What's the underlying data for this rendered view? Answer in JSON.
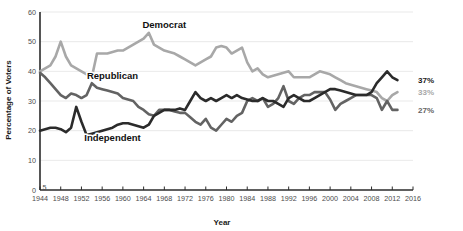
{
  "chart_data": {
    "type": "line",
    "title": "",
    "xlabel": "Year",
    "ylabel": "Percentage of Voters",
    "xlim": [
      1944,
      2016
    ],
    "ylim": [
      0,
      60
    ],
    "grid": true,
    "legend_position": "inline-annotations",
    "xticks": [
      1944,
      1948,
      1952,
      1956,
      1960,
      1964,
      1968,
      1972,
      1976,
      1980,
      1984,
      1988,
      1992,
      1996,
      2000,
      2004,
      2008,
      2012,
      2016
    ],
    "xtick_labels": [
      "1944",
      "1948",
      "1952",
      "1956",
      "1960",
      "1964",
      "1968",
      "1972",
      "1976",
      "1980",
      "1984",
      "1988",
      "1992",
      "1996",
      "2000",
      "2004",
      "2008",
      "2012",
      "2016"
    ],
    "yticks": [
      0,
      10,
      20,
      30,
      40,
      50,
      60
    ],
    "ytick_labels": [
      "0",
      "10",
      "20",
      "30",
      "40",
      "50",
      "60"
    ],
    "y_axis_break_marker": "5",
    "series": [
      {
        "name": "Democrat",
        "color": "#a8a8a8",
        "label_x": 1968,
        "label_y": 54.5,
        "end_label": "33%",
        "x": [
          1944,
          1945,
          1946,
          1947,
          1948,
          1949,
          1950,
          1951,
          1952,
          1953,
          1954,
          1955,
          1956,
          1957,
          1958,
          1959,
          1960,
          1961,
          1962,
          1963,
          1964,
          1965,
          1966,
          1967,
          1968,
          1969,
          1970,
          1971,
          1972,
          1973,
          1974,
          1975,
          1976,
          1977,
          1978,
          1979,
          1980,
          1981,
          1982,
          1983,
          1984,
          1985,
          1986,
          1987,
          1988,
          1989,
          1990,
          1991,
          1992,
          1993,
          1994,
          1995,
          1996,
          1997,
          1998,
          1999,
          2000,
          2001,
          2002,
          2003,
          2004,
          2005,
          2006,
          2007,
          2008,
          2009,
          2010,
          2011,
          2012,
          2013
        ],
        "y": [
          40,
          41,
          42,
          45,
          50,
          45,
          42,
          41,
          40,
          39,
          38,
          46,
          46,
          46,
          46.5,
          47,
          47,
          48,
          49,
          50,
          51,
          53,
          49,
          48,
          47,
          46.5,
          46,
          45,
          44,
          43,
          42,
          43,
          44,
          45,
          48,
          48.5,
          48,
          46,
          47,
          48,
          43,
          40,
          41,
          39,
          38,
          38.5,
          39,
          39.5,
          40,
          38,
          38,
          38,
          38,
          39,
          40,
          39.5,
          39,
          38,
          37,
          36,
          35.5,
          35,
          34.5,
          34,
          33.5,
          33,
          31,
          30,
          32,
          33
        ]
      },
      {
        "name": "Republican",
        "color": "#636363",
        "label_x": 1958,
        "label_y": 37.5,
        "end_label": "27%",
        "x": [
          1944,
          1945,
          1946,
          1947,
          1948,
          1949,
          1950,
          1951,
          1952,
          1953,
          1954,
          1955,
          1956,
          1957,
          1958,
          1959,
          1960,
          1961,
          1962,
          1963,
          1964,
          1965,
          1966,
          1967,
          1968,
          1969,
          1970,
          1971,
          1972,
          1973,
          1974,
          1975,
          1976,
          1977,
          1978,
          1979,
          1980,
          1981,
          1982,
          1983,
          1984,
          1985,
          1986,
          1987,
          1988,
          1989,
          1990,
          1991,
          1992,
          1993,
          1994,
          1995,
          1996,
          1997,
          1998,
          1999,
          2000,
          2001,
          2002,
          2003,
          2004,
          2005,
          2006,
          2007,
          2008,
          2009,
          2010,
          2011,
          2012,
          2013
        ],
        "y": [
          39.5,
          38,
          36,
          34,
          32,
          31,
          32.5,
          32,
          31,
          32,
          36,
          34.5,
          34,
          33.5,
          33,
          32.5,
          31,
          30.5,
          30,
          28,
          27,
          25.5,
          25,
          27,
          27,
          27,
          26.5,
          26,
          26,
          24.5,
          23,
          22,
          24,
          21,
          20,
          22,
          24,
          23,
          25,
          26,
          30,
          31,
          30,
          31,
          28,
          29,
          31,
          35,
          30,
          29,
          31,
          32,
          32,
          33,
          33,
          33,
          30.5,
          27,
          29,
          30,
          31,
          32,
          32,
          32,
          32,
          31,
          27,
          30,
          27,
          27
        ]
      },
      {
        "name": "Independent",
        "color": "#2b2b2b",
        "label_x": 1958,
        "label_y": 16.5,
        "end_label": "37%",
        "x": [
          1944,
          1945,
          1946,
          1947,
          1948,
          1949,
          1950,
          1951,
          1952,
          1953,
          1954,
          1955,
          1956,
          1957,
          1958,
          1959,
          1960,
          1961,
          1962,
          1963,
          1964,
          1965,
          1966,
          1967,
          1968,
          1969,
          1970,
          1971,
          1972,
          1973,
          1974,
          1975,
          1976,
          1977,
          1978,
          1979,
          1980,
          1981,
          1982,
          1983,
          1984,
          1985,
          1986,
          1987,
          1988,
          1989,
          1990,
          1991,
          1992,
          1993,
          1994,
          1995,
          1996,
          1997,
          1998,
          1999,
          2000,
          2001,
          2002,
          2003,
          2004,
          2005,
          2006,
          2007,
          2008,
          2009,
          2010,
          2011,
          2012,
          2013
        ],
        "y": [
          20,
          20.5,
          21,
          21,
          20.5,
          19.5,
          21,
          28,
          23,
          18.5,
          19,
          19.5,
          20,
          20.5,
          21,
          22,
          22.5,
          22.5,
          22,
          21.5,
          21,
          22,
          25,
          26,
          27,
          27,
          27,
          27.5,
          27,
          30,
          33,
          31,
          30,
          31,
          30,
          31,
          32,
          31,
          32,
          31,
          30.5,
          30,
          30,
          31,
          30,
          30,
          29,
          28,
          31,
          32,
          31,
          30,
          30,
          31,
          32,
          33,
          34,
          34,
          33.5,
          33,
          32.5,
          32,
          32,
          32,
          33,
          36,
          38,
          40,
          38,
          37
        ]
      }
    ]
  },
  "axis": {
    "y_title": "Percentage of Voters",
    "x_title": "Year"
  },
  "end_labels": [
    {
      "name": "independent-end-label",
      "text": "37%",
      "color": "#1a1a1a",
      "value": 37
    },
    {
      "name": "democrat-end-label",
      "text": "33%",
      "color": "#a8a8a8",
      "value": 33
    },
    {
      "name": "republican-end-label",
      "text": "27%",
      "color": "#636363",
      "value": 27
    }
  ],
  "series_labels": [
    {
      "name": "democrat-series-label",
      "text": "Democrat"
    },
    {
      "name": "republican-series-label",
      "text": "Republican"
    },
    {
      "name": "independent-series-label",
      "text": "Independent"
    }
  ],
  "colors": {
    "democrat": "#a8a8a8",
    "republican": "#636363",
    "independent": "#2b2b2b",
    "axis": "#2b2b2b",
    "grid": "#e3e3e3",
    "tick_text": "#4c4c4c"
  }
}
